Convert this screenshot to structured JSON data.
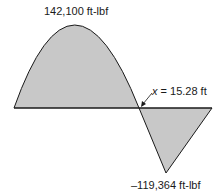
{
  "diagram": {
    "type": "bending-moment-diagram",
    "fill_color": "#c8c8c8",
    "stroke_color": "#1a1a1a",
    "labels": {
      "max_moment": "142,100 ft-lbf",
      "zero_crossing_var": "x",
      "zero_crossing_rest": " = 15.28 ft",
      "min_moment": "–119,364 ft-lbf"
    },
    "regions": [
      {
        "name": "positive-moment-region",
        "shape": "parabola",
        "peak_value": "142,100 ft-lbf"
      },
      {
        "name": "negative-moment-region",
        "shape": "triangle",
        "min_value": "-119,364 ft-lbf"
      }
    ],
    "zero_crossing": "x = 15.28 ft"
  }
}
